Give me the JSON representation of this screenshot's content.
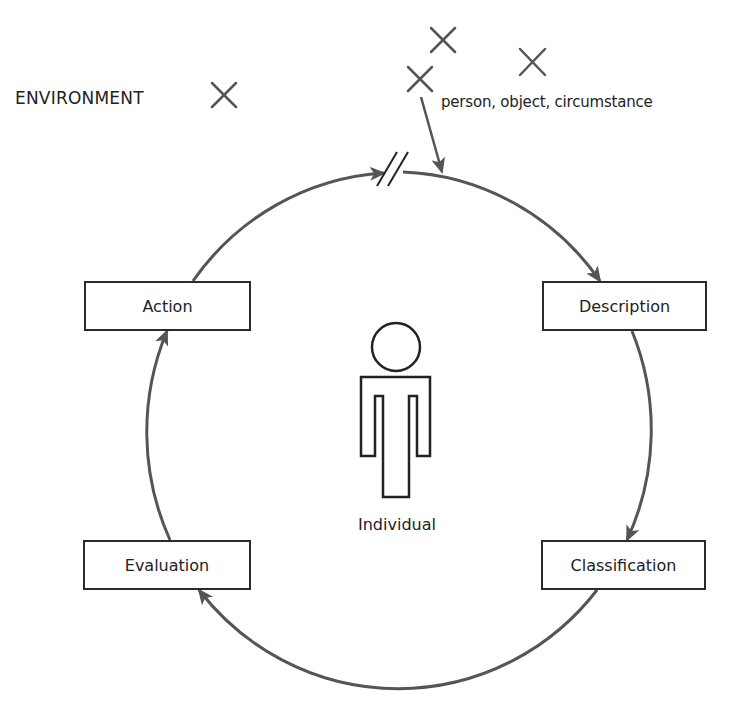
{
  "diagram": {
    "environment_label": "ENVIRONMENT",
    "stimulus_label": "person, object, circumstance",
    "individual_label": "Individual",
    "stages": [
      {
        "id": "action",
        "label": "Action"
      },
      {
        "id": "description",
        "label": "Description"
      },
      {
        "id": "classification",
        "label": "Classification"
      },
      {
        "id": "evaluation",
        "label": "Evaluation"
      }
    ],
    "cycle_order": [
      "Description",
      "Classification",
      "Evaluation",
      "Action"
    ],
    "environment_markers": 4,
    "colors": {
      "stroke": "#555555",
      "box_border": "#2a2a2a",
      "text": "#222222",
      "background": "#ffffff"
    }
  }
}
